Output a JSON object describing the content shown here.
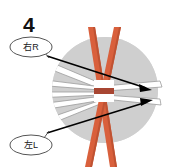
{
  "figure": {
    "step_number": "4",
    "background_color": "#ffffff",
    "circle": {
      "label": "gray-disc",
      "fill_color": "#d2d2d2",
      "cx": 105,
      "cy": 90,
      "r": 53
    },
    "poles": {
      "label": "crossed-poles",
      "color": "#d9603c",
      "shadow_color": "#b34c2e",
      "count": 2
    },
    "center_marker": {
      "label": "center-band",
      "color": "#a84632"
    },
    "skis": {
      "label": "white-ski-shapes",
      "fill_color": "#ffffff",
      "edge_color": "#9a9a9a",
      "count": 6
    },
    "arrows": {
      "label": "motion-arrows",
      "color": "#000000",
      "count": 2
    },
    "callouts": [
      {
        "id": "right-callout",
        "text": "右R",
        "cx": 31,
        "cy": 47
      },
      {
        "id": "left-callout",
        "text": "左L",
        "cx": 31,
        "cy": 145
      }
    ]
  }
}
